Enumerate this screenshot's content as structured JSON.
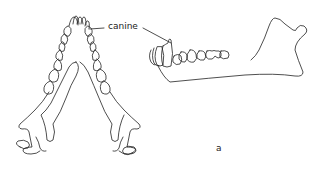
{
  "figure": {
    "views": [
      {
        "name": "ventral-view-mandible",
        "description": "Lower jaw seen from above, V-shaped with teeth along both rami"
      },
      {
        "name": "lateral-view-mandible",
        "description": "Lower jaw seen from the side with incisors, canine, premolars and molars"
      }
    ],
    "annotations": {
      "canine_label": "canine",
      "panel_label": "a"
    },
    "colors": {
      "stroke": "#222222",
      "background": "#ffffff"
    }
  }
}
